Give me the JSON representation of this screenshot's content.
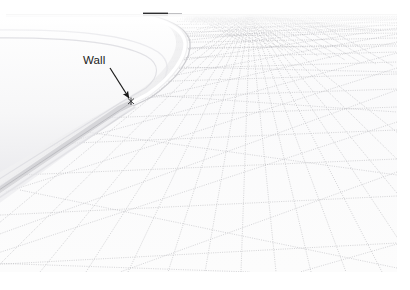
{
  "figure": {
    "type": "mesh-visualization",
    "background_color": "#ffffff",
    "content_area": {
      "x": 0,
      "y": 0,
      "width": 397,
      "height": 272
    }
  },
  "annotations": [
    {
      "id": "wall",
      "label": "Wall",
      "label_x": 83,
      "label_y": 54,
      "arrow_from_x": 110,
      "arrow_from_y": 68,
      "arrow_to_x": 131,
      "arrow_to_y": 100,
      "marker_x": 131,
      "marker_y": 101,
      "color": "#1a1a1a"
    }
  ],
  "colors": {
    "mesh_line": "#b9b9bd",
    "mesh_line_dense": "#a8a8ae",
    "horizon_line": "#8f8f93",
    "horizon_dark_segment": "#2e2e30",
    "wall_fill": "#f3f3f4",
    "wall_shade": "#e2e2e4",
    "wall_edge": "#c9c9cd",
    "ground_fill": "#fbfbfb",
    "annotation": "#1a1a1a"
  },
  "horizon": {
    "y": 14,
    "x_start": 6,
    "x_end": 397,
    "dark_segment_x_start": 143,
    "dark_segment_x_end": 168,
    "dark_segment_y": 13,
    "dark_segment_height": 3
  },
  "wall": {
    "name": "curved-wall-structure",
    "apex_x": 182,
    "apex_y": 36,
    "base_left_x": 0,
    "base_left_y": 196,
    "rim_highlight": true
  },
  "mesh": {
    "name": "triangular-surface-mesh",
    "style": "dotted",
    "near_cell_size_px": 95,
    "far_cell_size_px": 6,
    "vanishing_point_x": 250,
    "vanishing_point_y": 14,
    "longitudinal_line_count": 26,
    "transverse_line_count": 22,
    "diagonal_line_count": 24,
    "ground_vertices": [
      [
        41,
        171
      ],
      [
        131,
        101
      ],
      [
        174,
        146
      ],
      [
        234,
        119
      ],
      [
        263,
        180
      ],
      [
        150,
        236
      ],
      [
        312,
        152
      ],
      [
        356,
        205
      ],
      [
        205,
        263
      ],
      [
        88,
        272
      ],
      [
        300,
        268
      ],
      [
        380,
        244
      ]
    ]
  }
}
